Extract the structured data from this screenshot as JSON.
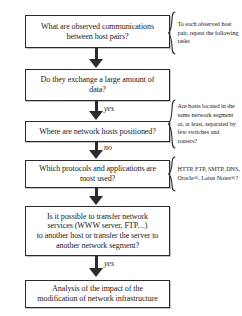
{
  "diagram": {
    "colors": {
      "stroke": "#2b2b2b",
      "background": "#ffffff",
      "text": "#1b1b1b"
    },
    "nodes": [
      {
        "id": "node-1",
        "name": "observed-communications",
        "text": "What are observed communications\nbetween host pairs?"
      },
      {
        "id": "node-2",
        "name": "large-amount-of-data",
        "text": "Do they exchange a large amount of\ndata?"
      },
      {
        "id": "node-3",
        "name": "network-hosts-positioned",
        "text": "Where are network hosts positioned?"
      },
      {
        "id": "node-4",
        "name": "protocols-and-applications",
        "text": "Which protocols and applications are\nmost used?"
      },
      {
        "id": "node-5",
        "name": "transfer-network-services",
        "text": "Is it possible to transfer network\nservices (WWW server, FTP....)\nto another host or transfer the server to\nanother network segment?"
      },
      {
        "id": "node-6",
        "name": "analysis-of-impact",
        "text": "Analysis of the impact of the\nmodification of network infrastructure"
      }
    ],
    "edge_labels": [
      {
        "id": "label-yes-1",
        "name": "edge-label-yes-data",
        "text": "yes"
      },
      {
        "id": "label-no-1",
        "name": "edge-label-no-position",
        "text": "no"
      },
      {
        "id": "label-yes-2",
        "name": "edge-label-yes-transfer",
        "text": "yes"
      }
    ],
    "annotations": [
      {
        "id": "annot-1",
        "name": "annotation-repeat-tasks",
        "text": "To each observed host pair,  repeat the following tasks"
      },
      {
        "id": "annot-2",
        "name": "annotation-hosts-located",
        "text": "Are hosts located in the same network segment or, at least, separated by few switches and  routers?"
      },
      {
        "id": "annot-3",
        "name": "annotation-protocol-list",
        "text": "HTTP, FTP, SMTP, DNS, Oracle®, Lotus Notes®?"
      }
    ]
  }
}
